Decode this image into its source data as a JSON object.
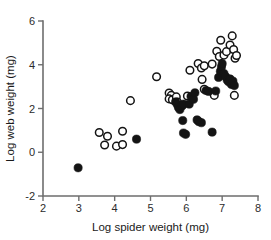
{
  "chart_data": {
    "type": "scatter",
    "title": "",
    "xlabel": "Log spider weight (mg)",
    "ylabel": "Log web weight (mg)",
    "xlim": [
      2,
      8
    ],
    "ylim": [
      -2,
      6
    ],
    "xticks": [
      2,
      3,
      4,
      5,
      6,
      7,
      8
    ],
    "yticks": [
      -2,
      0,
      2,
      4,
      6
    ],
    "xtick_labels": [
      "2",
      "3",
      "4",
      "5",
      "6",
      "7",
      "8"
    ],
    "ytick_labels": [
      "-2",
      "0",
      "2",
      "4",
      "6"
    ],
    "grid": false,
    "legend": "none",
    "series": [
      {
        "name": "open",
        "marker": "open-circle",
        "marker_color": "#141414",
        "marker_fill": "#ffffff",
        "points": [
          [
            3.57,
            0.9
          ],
          [
            3.8,
            0.73
          ],
          [
            3.72,
            0.33
          ],
          [
            4.05,
            0.28
          ],
          [
            4.22,
            0.35
          ],
          [
            4.22,
            0.96
          ],
          [
            4.44,
            2.36
          ],
          [
            5.17,
            3.45
          ],
          [
            5.52,
            2.71
          ],
          [
            5.58,
            2.6
          ],
          [
            5.52,
            2.44
          ],
          [
            5.61,
            2.4
          ],
          [
            5.72,
            2.53
          ],
          [
            5.75,
            2.3
          ],
          [
            6.03,
            2.57
          ],
          [
            6.1,
            3.75
          ],
          [
            6.33,
            4.06
          ],
          [
            6.42,
            3.85
          ],
          [
            6.5,
            3.95
          ],
          [
            6.44,
            3.33
          ],
          [
            6.5,
            2.88
          ],
          [
            6.78,
            2.6
          ],
          [
            6.72,
            4.03
          ],
          [
            6.85,
            4.62
          ],
          [
            6.92,
            4.38
          ],
          [
            6.96,
            5.12
          ],
          [
            7.05,
            4.44
          ],
          [
            7.12,
            4.6
          ],
          [
            7.22,
            4.9
          ],
          [
            7.28,
            5.32
          ],
          [
            7.32,
            4.7
          ],
          [
            7.36,
            4.3
          ],
          [
            7.4,
            4.42
          ],
          [
            7.34,
            2.6
          ]
        ]
      },
      {
        "name": "filled",
        "marker": "filled-circle",
        "marker_color": "#141414",
        "marker_fill": "#141414",
        "points": [
          [
            2.98,
            -0.71
          ],
          [
            4.61,
            0.6
          ],
          [
            5.7,
            2.3
          ],
          [
            5.75,
            2.18
          ],
          [
            5.78,
            2.05
          ],
          [
            5.82,
            1.95
          ],
          [
            5.88,
            2.12
          ],
          [
            5.92,
            2.2
          ],
          [
            5.9,
            1.45
          ],
          [
            5.92,
            0.88
          ],
          [
            5.98,
            0.82
          ],
          [
            6.08,
            2.2
          ],
          [
            6.13,
            2.55
          ],
          [
            6.2,
            2.42
          ],
          [
            6.24,
            2.72
          ],
          [
            6.35,
            1.4
          ],
          [
            6.42,
            1.35
          ],
          [
            6.3,
            1.48
          ],
          [
            6.55,
            2.82
          ],
          [
            6.62,
            2.78
          ],
          [
            6.72,
            0.92
          ],
          [
            6.82,
            2.8
          ],
          [
            6.9,
            3.42
          ],
          [
            6.95,
            3.7
          ],
          [
            6.98,
            3.9
          ],
          [
            7.0,
            4.05
          ],
          [
            7.05,
            3.6
          ],
          [
            7.1,
            3.45
          ],
          [
            7.14,
            3.3
          ],
          [
            7.18,
            3.22
          ],
          [
            7.22,
            3.35
          ],
          [
            7.26,
            3.1
          ],
          [
            7.3,
            3.25
          ],
          [
            7.34,
            3.05
          ]
        ]
      }
    ]
  },
  "axes": {
    "x_axis_name": "x-axis",
    "y_axis_name": "y-axis"
  }
}
